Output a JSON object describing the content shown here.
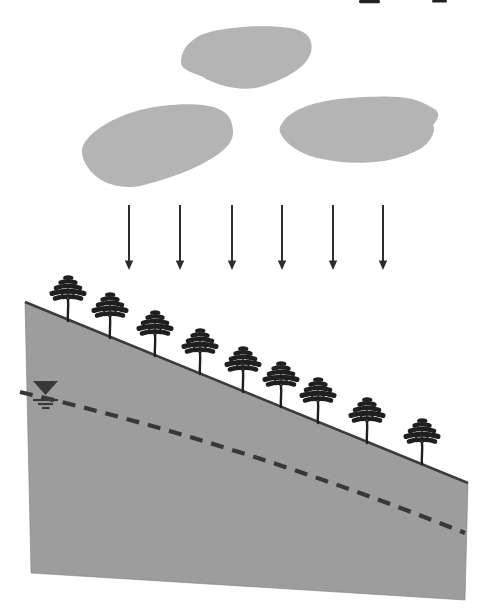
{
  "figure": {
    "description": "Schematic diagram: rain falling from three clouds onto a tree-covered hillslope with a dashed groundwater table line and water-table symbol"
  },
  "colors": {
    "background": "#ffffff",
    "cloud_fill": "#b4b4b4",
    "slope_fill": "#9d9d9d",
    "slope_edge": "#7a7a7a",
    "surface_line": "#3c3c3c",
    "tree": "#1f1f1f",
    "arrow": "#2d2d2d",
    "water_table_dash": "#383838",
    "edge_mark": "#222222"
  },
  "top_edge_marks": [
    {
      "x": 359,
      "y": 0,
      "w": 21,
      "h": 3.2
    },
    {
      "x": 432,
      "y": 0,
      "w": 15,
      "h": 2.6
    }
  ],
  "clouds": [
    {
      "name": "cloud-top",
      "path": "M 193 40 C 202 33 212 31 225 29 C 245 26 270 25 290 28 C 302 30 309 34 311 42 C 313 50 310 58 303 65 C 295 73 275 84 255 88 C 238 91 215 85 203 77 C 192 72 181 70 181 62 C 181 53 186 45 193 40 Z"
    },
    {
      "name": "cloud-left",
      "path": "M 97 130 C 108 121 125 114 140 110 C 160 105 185 103 203 105 C 218 107 228 112 231 121 C 234 130 234 137 229 144 C 222 153 213 158 200 165 C 182 174 160 181 140 186 C 124 189 107 185 97 177 C 88 170 83 161 82 153 C 81 144 89 136 97 130 Z"
    },
    {
      "name": "cloud-right",
      "path": "M 280 127 C 284 118 292 112 302 108 C 318 101 340 98 365 97 C 385 96 400 96 412 99 C 420 101 430 106 436 110 C 440 114 438 120 433 125 C 436 130 432 140 423 147 C 412 154 400 158 384 161 C 362 164 340 163 322 159 C 306 156 291 148 284 139 C 280 133 279 131 280 127 Z"
    }
  ],
  "rain_arrows": {
    "x_positions": [
      129,
      180,
      232,
      282,
      333,
      383
    ],
    "y_top": 205,
    "y_tip": 270
  },
  "hillslope": {
    "polygon_points": "25,302 468,483 465,600 31,573",
    "surface_line": {
      "x1": 25,
      "y1": 302,
      "x2": 468,
      "y2": 483
    }
  },
  "water_table": {
    "dash_path": "M 20 392 Q 240 443 465 533",
    "dash_pattern": "13 9",
    "symbol": {
      "triangle_points": "33,381 58,381 45.5,395",
      "lines": [
        {
          "x1": 33,
          "x2": 58,
          "y": 400
        },
        {
          "x1": 38,
          "x2": 53,
          "y": 404
        },
        {
          "x1": 42,
          "x2": 49.5,
          "y": 408
        }
      ]
    }
  },
  "trees": {
    "count": 9,
    "positions": [
      {
        "x": 68,
        "y": 321
      },
      {
        "x": 110,
        "y": 338
      },
      {
        "x": 155,
        "y": 356
      },
      {
        "x": 200,
        "y": 374
      },
      {
        "x": 243,
        "y": 392
      },
      {
        "x": 281,
        "y": 407
      },
      {
        "x": 318,
        "y": 423
      },
      {
        "x": 367,
        "y": 443
      },
      {
        "x": 422,
        "y": 464
      }
    ]
  }
}
